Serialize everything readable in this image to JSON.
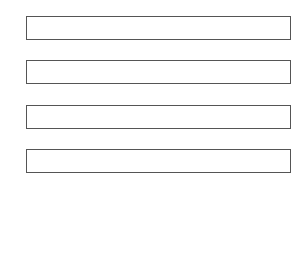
{
  "form": {
    "fields": [
      {
        "value": "",
        "placeholder": ""
      },
      {
        "value": "",
        "placeholder": ""
      },
      {
        "value": "",
        "placeholder": ""
      },
      {
        "value": "",
        "placeholder": ""
      }
    ]
  },
  "colors": {
    "background": "#ffffff",
    "border": "#555555"
  }
}
